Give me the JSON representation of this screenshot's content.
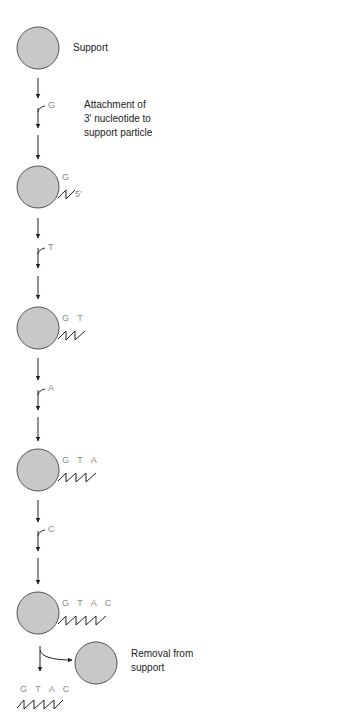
{
  "diagram": {
    "type": "solid-phase oligonucleotide synthesis",
    "colors": {
      "support_fill": "#c8c8c8",
      "support_stroke": "#555555",
      "line": "#222222",
      "nucleotide_label": "#8a8a8a"
    },
    "labels": {
      "support": "Support",
      "attachment_line1": "Attachment of",
      "attachment_line2": "3′ nucleotide to",
      "attachment_line3": "support particle",
      "removal_line1": "Removal from",
      "removal_line2": "support",
      "five_prime": "5′"
    },
    "steps": [
      {
        "added": "G",
        "chain": "G"
      },
      {
        "added": "T",
        "chain": "G T"
      },
      {
        "added": "A",
        "chain": "G T A"
      },
      {
        "added": "C",
        "chain": "G T A C"
      }
    ],
    "released_chain": "G T A C"
  }
}
